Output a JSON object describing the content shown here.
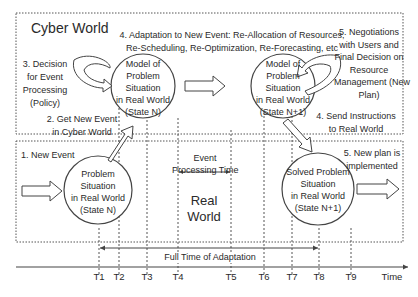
{
  "cyber_world": {
    "title": "Cyber World",
    "step3": [
      "3. Decision",
      "for Event",
      "Processing",
      "(Policy)"
    ],
    "step2": [
      "2. Get New Event",
      "in Cyber World"
    ],
    "step4_header": [
      "4. Adaptation to New Event: Re-Allocation of Resources,",
      "Re-Scheduling, Re-Optimization, Re-Forecasting, etc"
    ],
    "step5": [
      "5. Negotiations",
      "with Users and",
      "Final Decision on",
      "Resource",
      "Management (New",
      "Plan)"
    ],
    "step4_send": [
      "4. Send Instructions",
      "to Real World"
    ],
    "model_n": [
      "Model of",
      "Problem",
      "Situation",
      "in Real World",
      "(State N)"
    ],
    "model_n1": [
      "Model of",
      "Problem",
      "Situation",
      "in Real World",
      "(State N+1)"
    ]
  },
  "real_world": {
    "title": [
      "Real",
      "World"
    ],
    "step1": "1. New Event",
    "event_processing": [
      "Event",
      "Processing Time"
    ],
    "problem_n": [
      "Problem",
      "Situation",
      "in Real World",
      "(State N)"
    ],
    "solved_n1": [
      "Solved Problem",
      "Situation",
      "in Real World",
      "(State N+1)"
    ],
    "step5": [
      "5. New plan is",
      "implemented"
    ]
  },
  "timeline": {
    "full_time_label": "Full Time of Adaptation",
    "ticks": [
      "T1",
      "T2",
      "T3",
      "T4",
      "T5",
      "T6",
      "T7",
      "T8",
      "T9"
    ],
    "axis_label": "Time"
  },
  "colors": {
    "line": "#444444",
    "text": "#2a2a2a",
    "background": "#ffffff"
  }
}
